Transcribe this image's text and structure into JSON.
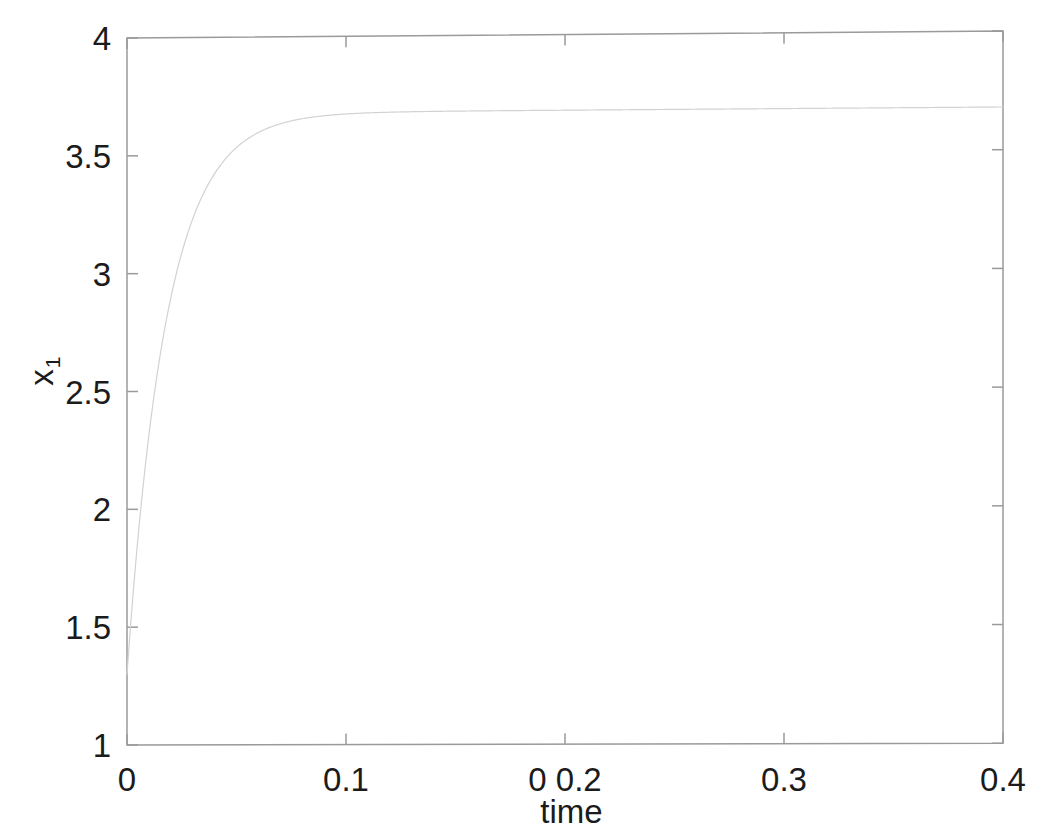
{
  "figure": {
    "background_color": "#ffffff",
    "axis_color": "#9a9a9a",
    "text_color": "#1b1b1b",
    "line_color": "#d2d2d2"
  },
  "axes": {
    "x": {
      "label": "time",
      "min": 0,
      "max": 0.4,
      "ticks": [
        0,
        0.1,
        0.2,
        0.3,
        0.4
      ],
      "tick_labels": [
        "0",
        "0.1",
        "0 0.2",
        "0.3",
        "0.4"
      ]
    },
    "y": {
      "label_base": "x",
      "label_sub": "1",
      "min": 1,
      "max": 4,
      "ticks": [
        1,
        1.5,
        2,
        2.5,
        3,
        3.5,
        4
      ],
      "tick_labels": [
        "1",
        "1.5",
        "2",
        "2.5",
        "3",
        "3.5",
        "4"
      ]
    }
  },
  "chart_data": {
    "type": "line",
    "title": "",
    "xlabel": "time",
    "ylabel": "x_1",
    "xlim": [
      0,
      0.4
    ],
    "ylim": [
      1,
      4
    ],
    "grid": false,
    "legend": null,
    "series": [
      {
        "name": "x1",
        "color": "#d2d2d2",
        "linewidth": 1.2,
        "initial_value": 1.3,
        "steady_state": 3.68,
        "time_constant": 0.018,
        "x": [
          0,
          0.002,
          0.004,
          0.006,
          0.008,
          0.01,
          0.012,
          0.014,
          0.016,
          0.018,
          0.02,
          0.023,
          0.026,
          0.03,
          0.034,
          0.038,
          0.042,
          0.046,
          0.05,
          0.055,
          0.06,
          0.065,
          0.07,
          0.08,
          0.09,
          0.1,
          0.12,
          0.14,
          0.16,
          0.18,
          0.2,
          0.24,
          0.28,
          0.32,
          0.36,
          0.4
        ],
        "y": [
          1.3,
          1.55,
          1.78,
          1.99,
          2.18,
          2.36,
          2.52,
          2.67,
          2.8,
          2.92,
          3.03,
          3.17,
          3.28,
          3.41,
          3.5,
          3.56,
          3.6,
          3.62,
          3.64,
          3.655,
          3.663,
          3.668,
          3.671,
          3.675,
          3.677,
          3.678,
          3.679,
          3.68,
          3.68,
          3.68,
          3.68,
          3.681,
          3.681,
          3.681,
          3.681,
          3.681
        ]
      }
    ]
  }
}
